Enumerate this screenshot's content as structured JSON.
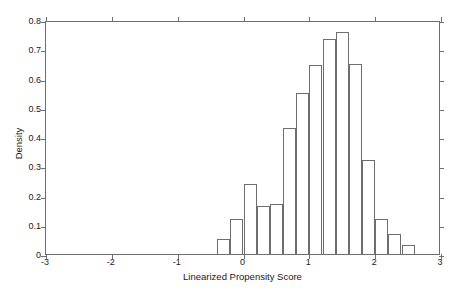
{
  "chart_data": {
    "type": "bar",
    "title": "",
    "subtitle": "",
    "xlabel": "Linearized Propensity Score",
    "ylabel": "Density",
    "xlim": [
      -3,
      3
    ],
    "ylim": [
      0,
      0.8
    ],
    "xticks": [
      -3,
      -2,
      -1,
      0,
      1,
      2,
      3
    ],
    "xtick_labels": [
      "-3",
      "-2",
      "-1",
      "0",
      "1",
      "2",
      "3"
    ],
    "yticks": [
      0,
      0.1,
      0.2,
      0.3,
      0.4,
      0.5,
      0.6,
      0.7,
      0.8
    ],
    "ytick_labels": [
      "0",
      "0.1",
      "0.2",
      "0.3",
      "0.4",
      "0.5",
      "0.6",
      "0.7",
      "0.8"
    ],
    "grid": false,
    "legend": null,
    "bin_width": 0.2,
    "bin_edges": [
      -0.4,
      -0.2,
      0.0,
      0.2,
      0.4,
      0.6,
      0.8,
      1.0,
      1.2,
      1.4,
      1.6,
      1.8,
      2.0,
      2.2,
      2.4,
      2.6
    ],
    "bin_centers": [
      -0.3,
      -0.1,
      0.1,
      0.3,
      0.5,
      0.7,
      0.9,
      1.1,
      1.3,
      1.5,
      1.7,
      1.9,
      2.1,
      2.3,
      2.5
    ],
    "values": [
      0.05,
      0.12,
      0.24,
      0.165,
      0.17,
      0.43,
      0.55,
      0.645,
      0.735,
      0.76,
      0.65,
      0.32,
      0.12,
      0.07,
      0.03
    ],
    "bar_style": {
      "fill": "none",
      "edge_color": "#6e6e6e",
      "edge_width": 1
    },
    "axis_color": "#6e6e6e",
    "background": "#ffffff"
  }
}
